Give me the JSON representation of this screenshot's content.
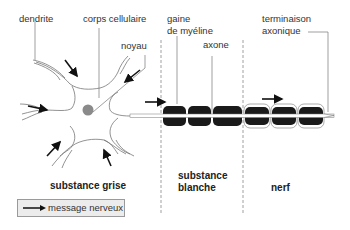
{
  "labels": {
    "dendrite": "dendrite",
    "corps_cellulaire": "corps cellulaire",
    "noyau": "noyau",
    "gaine_line1": "gaine",
    "gaine_line2": "de myéline",
    "axone": "axone",
    "terminaison_line1": "terminaison",
    "terminaison_line2": "axonique"
  },
  "regions": {
    "substance_grise": "substance grise",
    "substance_blanche_line1": "substance",
    "substance_blanche_line2": "blanche",
    "nerf": "nerf"
  },
  "legend": {
    "label": "message nerveux",
    "icon": "arrow-right-icon"
  },
  "colors": {
    "myelin": "#1a1a1a",
    "nucleus": "#8a8a8a",
    "outline": "#777777",
    "arrow": "#111111",
    "divider": "#888888",
    "legend_bg": "#ececec"
  }
}
